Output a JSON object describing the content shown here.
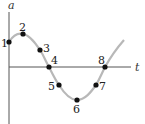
{
  "diagram": {
    "type": "sinusoidal motion graph",
    "axes": {
      "vertical_label": "a",
      "horizontal_label": "t"
    },
    "curve_color": "#b8b8b8",
    "axis_color": "#555555",
    "point_color": "#111111",
    "points": [
      {
        "label": "1",
        "x": 9,
        "y": 42,
        "lx": 1,
        "ly": 47
      },
      {
        "label": "2",
        "x": 23,
        "y": 34,
        "lx": 19,
        "ly": 31
      },
      {
        "label": "3",
        "x": 40,
        "y": 50,
        "lx": 43,
        "ly": 52
      },
      {
        "label": "4",
        "x": 49,
        "y": 67,
        "lx": 51,
        "ly": 64
      },
      {
        "label": "5",
        "x": 59,
        "y": 85,
        "lx": 48,
        "ly": 90
      },
      {
        "label": "6",
        "x": 77,
        "y": 100,
        "lx": 73,
        "ly": 113
      },
      {
        "label": "7",
        "x": 96,
        "y": 85,
        "lx": 99,
        "ly": 90
      },
      {
        "label": "8",
        "x": 105,
        "y": 67,
        "lx": 98,
        "ly": 64
      }
    ]
  }
}
